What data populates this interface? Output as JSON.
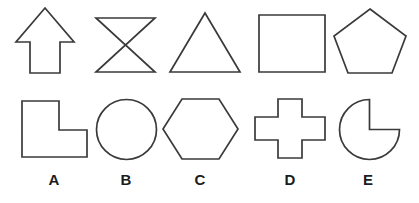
{
  "figure": {
    "background_color": "#ffffff",
    "stroke_color": "#3a3a3a",
    "label_color": "#1c1c1c",
    "width": 419,
    "height": 203,
    "top_row": [
      {
        "id": "arrow-up",
        "name": "up-arrow",
        "points": "45,8 74,42 60,42 60,73 30,73 30,42 16,42"
      },
      {
        "id": "bowtie",
        "name": "bowtie-hourglass",
        "points": "96,18 155,18 125.5,45 155,72 96,72 125.5,45"
      },
      {
        "id": "triangle",
        "name": "triangle",
        "points": "205,13 240,72 170,72"
      },
      {
        "id": "square",
        "name": "square",
        "points": "259,15 325,15 325,72 259,72"
      },
      {
        "id": "pentagon",
        "name": "pentagon",
        "points": "370,9 406,36 392,73 348,73 334,36"
      }
    ],
    "bottom_row": [
      {
        "id": "l-shape",
        "name": "l-shape",
        "label": "A",
        "label_x": 54,
        "points": "22,101 59,101 59,130 87,130 87,157 22,157"
      },
      {
        "id": "circle",
        "name": "circle",
        "label": "B",
        "label_x": 126,
        "cx": 126.5,
        "cy": 129.5,
        "r": 30
      },
      {
        "id": "hexagon",
        "name": "hexagon",
        "label": "C",
        "label_x": 200,
        "points": "182,99 219,99 238,129 219,159 182,159 163,129"
      },
      {
        "id": "cross",
        "name": "cross-plus",
        "label": "D",
        "label_x": 290,
        "points": "278,99 302,99 302,117 325,117 325,140 302,140 302,158 278,158 278,140 255,140 255,117 278,117"
      },
      {
        "id": "pacman",
        "name": "pacman-three-quarter-circle",
        "label": "E",
        "label_x": 368,
        "cx": 369.5,
        "cy": 129.5,
        "r": 30,
        "path": "M 369.5 99.5 L 369.5 129.5 L 399.5 129.5 A 30 30 0 1 1 369.5 99.5 Z"
      }
    ]
  }
}
